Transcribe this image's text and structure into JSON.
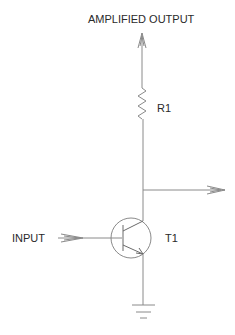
{
  "diagram": {
    "type": "circuit-schematic",
    "labels": {
      "output_top": "AMPLIFIED OUTPUT",
      "resistor": "R1",
      "input": "INPUT",
      "transistor": "T1"
    },
    "components": [
      {
        "id": "R1",
        "kind": "resistor",
        "position": "between output terminal and collector"
      },
      {
        "id": "T1",
        "kind": "NPN transistor",
        "position": "center"
      },
      {
        "id": "GND",
        "kind": "ground",
        "position": "below emitter"
      }
    ],
    "connections": [
      {
        "from": "INPUT",
        "to": "T1.base"
      },
      {
        "from": "AMPLIFIED OUTPUT",
        "to": "R1"
      },
      {
        "from": "R1",
        "to": "T1.collector"
      },
      {
        "from": "T1.collector",
        "to": "output-branch-arrow"
      },
      {
        "from": "T1.emitter",
        "to": "GND"
      }
    ],
    "colors": {
      "wire": "#8a8a8a",
      "text": "#2a2a2a",
      "background": "#ffffff"
    }
  }
}
